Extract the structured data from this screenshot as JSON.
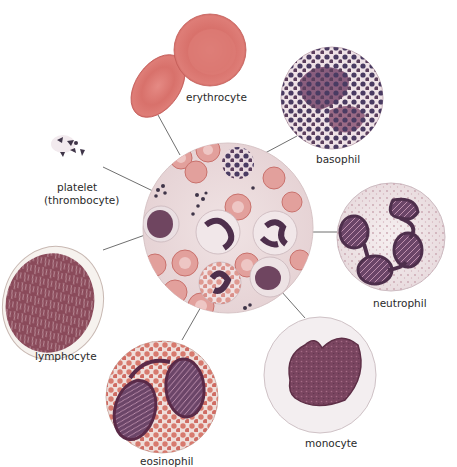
{
  "diagram": {
    "type": "blood-cell-types",
    "center": {
      "name": "blood-smear",
      "description": "magnified view of blood"
    },
    "cells": [
      {
        "id": "erythrocyte",
        "label": "erythrocyte"
      },
      {
        "id": "basophil",
        "label": "basophil"
      },
      {
        "id": "platelet",
        "label": "platelet",
        "label2": "(thrombocyte)"
      },
      {
        "id": "neutrophil",
        "label": "neutrophil"
      },
      {
        "id": "lymphocyte",
        "label": "lymphocyte"
      },
      {
        "id": "monocyte",
        "label": "monocyte"
      },
      {
        "id": "eosinophil",
        "label": "eosinophil"
      }
    ]
  },
  "colors": {
    "rbc": "#d9746f",
    "rbc_dark": "#c45a56",
    "nucleus": "#5a3a5c",
    "basophil_granule": "#4a3a60",
    "eosinophil_granule": "#d8786e",
    "cytoplasm": "#f1e7e8",
    "smear_bg": "#ecdcdd",
    "line": "#444444"
  }
}
